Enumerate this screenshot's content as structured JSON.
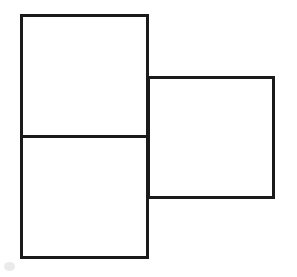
{
  "figure": {
    "canvas": {
      "width": 297,
      "height": 277,
      "background_color": "#ffffff"
    },
    "style": {
      "stroke_color": "#1a1a1a",
      "stroke_width": 3,
      "fill_color": "none"
    },
    "shapes": [
      {
        "name": "left-tall-rectangle",
        "kind": "rectangle",
        "x": 21,
        "y": 15,
        "width": 126,
        "height": 242,
        "label": "Left tall rectangle"
      },
      {
        "name": "left-rectangle-divider",
        "kind": "line",
        "x1": 21,
        "y1": 136,
        "x2": 147,
        "y2": 136,
        "label": "Horizontal divider splitting left rectangle into upper and lower cells"
      },
      {
        "name": "right-square",
        "kind": "rectangle",
        "x": 148,
        "y": 77,
        "width": 125,
        "height": 120,
        "label": "Right square"
      }
    ],
    "artifacts": [
      {
        "name": "scan-smudge",
        "kind": "smudge",
        "x": 4,
        "y": 262,
        "width": 11,
        "height": 9,
        "color": "#d8d8d8"
      }
    ],
    "annotations": {
      "shape_count": "3",
      "description": "A tall rectangle divided into two cells by a horizontal line, with a square attached to the right of the division point."
    }
  }
}
